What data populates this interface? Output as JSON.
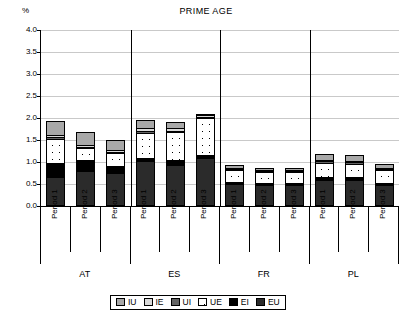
{
  "chart_data": {
    "type": "bar",
    "title": "PRIME AGE",
    "ylabel": "%",
    "xlabel": "",
    "stacked": true,
    "ylim": [
      0,
      4.0
    ],
    "yticks": [
      "0.0",
      "0.5",
      "1.0",
      "1.5",
      "2.0",
      "2.5",
      "3.0",
      "3.5",
      "4.0"
    ],
    "ytick_values": [
      0.0,
      0.5,
      1.0,
      1.5,
      2.0,
      2.5,
      3.0,
      3.5,
      4.0
    ],
    "grid": true,
    "legend_position": "bottom",
    "groups": [
      "AT",
      "ES",
      "FR",
      "PL"
    ],
    "categories": [
      "Period 1",
      "Period 2",
      "Period 3",
      "Period 1",
      "Period 2",
      "Period 3",
      "Period 1",
      "Period 2",
      "Period 3",
      "Period 1",
      "Period 2",
      "Period 3"
    ],
    "series": [
      {
        "name": "EU",
        "values": [
          0.64,
          0.78,
          0.72,
          1.0,
          0.92,
          1.08,
          0.48,
          0.46,
          0.47,
          0.58,
          0.58,
          0.46
        ]
      },
      {
        "name": "EI",
        "values": [
          0.31,
          0.24,
          0.18,
          0.07,
          0.11,
          0.06,
          0.04,
          0.04,
          0.04,
          0.06,
          0.05,
          0.05
        ]
      },
      {
        "name": "UE",
        "values": [
          0.57,
          0.29,
          0.31,
          0.59,
          0.64,
          0.87,
          0.31,
          0.27,
          0.26,
          0.34,
          0.33,
          0.31
        ]
      },
      {
        "name": "UI",
        "values": [
          0.04,
          0.03,
          0.02,
          0.05,
          0.04,
          0.02,
          0.02,
          0.02,
          0.02,
          0.03,
          0.03,
          0.02
        ]
      },
      {
        "name": "IE",
        "values": [
          0.05,
          0.04,
          0.03,
          0.06,
          0.05,
          0.03,
          0.02,
          0.02,
          0.02,
          0.03,
          0.03,
          0.02
        ]
      },
      {
        "name": "IU",
        "values": [
          0.33,
          0.31,
          0.24,
          0.19,
          0.14,
          0.04,
          0.06,
          0.05,
          0.05,
          0.14,
          0.13,
          0.09
        ]
      }
    ],
    "totals": [
      1.94,
      1.69,
      1.5,
      1.96,
      1.9,
      2.1,
      0.93,
      0.86,
      0.86,
      1.18,
      1.15,
      0.95
    ],
    "legend": [
      {
        "label": "IU",
        "color": "#a8a8a8",
        "pattern": "solid-gray"
      },
      {
        "label": "IE",
        "color": "#d9d9d9",
        "pattern": "solid-light-gray"
      },
      {
        "label": "UI",
        "color": "#636363",
        "pattern": "solid-dark-gray"
      },
      {
        "label": "UE",
        "color": "#ffffff",
        "pattern": "white-dotted"
      },
      {
        "label": "EI",
        "color": "#000000",
        "pattern": "solid-black"
      },
      {
        "label": "EU",
        "color": "#2b2b2b",
        "pattern": "solid-near-black"
      }
    ]
  }
}
